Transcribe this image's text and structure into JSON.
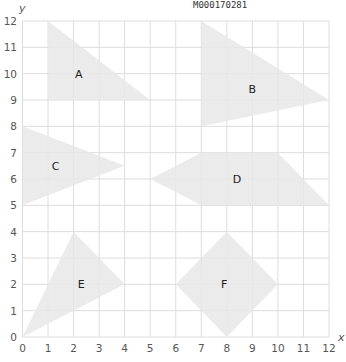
{
  "header": {
    "line1": "L⁠M⁠L⁠M⁠L⁠",
    "code": "M000170281"
  },
  "axes": {
    "x_label": "x",
    "y_label": "y",
    "x_ticks": [
      "0",
      "1",
      "2",
      "3",
      "4",
      "5",
      "6",
      "7",
      "8",
      "9",
      "10",
      "11",
      "12"
    ],
    "y_ticks": [
      "0",
      "1",
      "2",
      "3",
      "4",
      "5",
      "6",
      "7",
      "8",
      "9",
      "10",
      "11",
      "12"
    ],
    "xlim": [
      0,
      12
    ],
    "ylim": [
      0,
      12
    ],
    "grid": true
  },
  "colors": {
    "shape_fill": "#e8e8e8",
    "grid": "#dddddd",
    "tick_text": "#555555"
  },
  "shapes": [
    {
      "label": "A",
      "points": [
        [
          1,
          12
        ],
        [
          5,
          9
        ],
        [
          1,
          9
        ]
      ],
      "label_pos": [
        2.2,
        10
      ]
    },
    {
      "label": "B",
      "points": [
        [
          7,
          12
        ],
        [
          12,
          9
        ],
        [
          7,
          8
        ]
      ],
      "label_pos": [
        9,
        9.4
      ]
    },
    {
      "label": "C",
      "points": [
        [
          0,
          8
        ],
        [
          4,
          6.5
        ],
        [
          0,
          5
        ]
      ],
      "label_pos": [
        1.3,
        6.5
      ]
    },
    {
      "label": "D",
      "points": [
        [
          5,
          6
        ],
        [
          7,
          7
        ],
        [
          10,
          7
        ],
        [
          12,
          5
        ],
        [
          7,
          5
        ]
      ],
      "label_pos": [
        8.4,
        6
      ]
    },
    {
      "label": "E",
      "points": [
        [
          2,
          4
        ],
        [
          4,
          2
        ],
        [
          0,
          0
        ]
      ],
      "label_pos": [
        2.3,
        2
      ]
    },
    {
      "label": "F",
      "points": [
        [
          8,
          4
        ],
        [
          10,
          2
        ],
        [
          8,
          0
        ],
        [
          6,
          2
        ]
      ],
      "label_pos": [
        7.9,
        2
      ]
    }
  ],
  "chart_data": {
    "type": "scatter",
    "title": "",
    "xlabel": "x",
    "ylabel": "y",
    "xlim": [
      0,
      12
    ],
    "ylim": [
      0,
      12
    ],
    "grid": true,
    "series": [
      {
        "name": "A",
        "values": [
          [
            1,
            12
          ],
          [
            5,
            9
          ],
          [
            1,
            9
          ]
        ]
      },
      {
        "name": "B",
        "values": [
          [
            7,
            12
          ],
          [
            12,
            9
          ],
          [
            7,
            8
          ]
        ]
      },
      {
        "name": "C",
        "values": [
          [
            0,
            8
          ],
          [
            4,
            6.5
          ],
          [
            0,
            5
          ]
        ]
      },
      {
        "name": "D",
        "values": [
          [
            5,
            6
          ],
          [
            7,
            7
          ],
          [
            10,
            7
          ],
          [
            12,
            5
          ],
          [
            7,
            5
          ]
        ]
      },
      {
        "name": "E",
        "values": [
          [
            2,
            4
          ],
          [
            4,
            2
          ],
          [
            0,
            0
          ]
        ]
      },
      {
        "name": "F",
        "values": [
          [
            8,
            4
          ],
          [
            10,
            2
          ],
          [
            8,
            0
          ],
          [
            6,
            2
          ]
        ]
      }
    ]
  }
}
